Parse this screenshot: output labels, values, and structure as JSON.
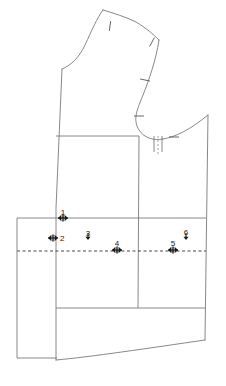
{
  "document": {
    "kind": "sewing-pattern-technical-drawing",
    "title": "Bodice Block Pattern Draft",
    "background_color": "#ffffff",
    "line_color": "#7a7a7a",
    "mark_color": "#1a1a1a",
    "width": 226,
    "height": 386
  },
  "annotations": {
    "numbered_markers": [
      {
        "id": "marker-1",
        "label": "1",
        "x": 63,
        "y": 218,
        "label_x": 63,
        "label_y": 215,
        "style": "double-arrow-horizontal",
        "arrow_width": 10
      },
      {
        "id": "marker-2",
        "label": "2",
        "x": 53,
        "y": 238,
        "label_x": 60,
        "label_y": 241,
        "style": "double-arrow-horizontal",
        "arrow_width": 10
      },
      {
        "id": "marker-3",
        "label": "3",
        "x": 88,
        "y": 240,
        "label_x": 88,
        "label_y": 236,
        "style": "down-arrow",
        "arrow_height": 7
      },
      {
        "id": "marker-4",
        "label": "4",
        "x": 117,
        "y": 250,
        "label_x": 117,
        "label_y": 246,
        "style": "double-arrow-horizontal",
        "arrow_width": 10
      },
      {
        "id": "marker-5",
        "label": "5",
        "x": 173,
        "y": 250,
        "label_x": 173,
        "label_y": 246,
        "style": "double-arrow-horizontal",
        "arrow_width": 10
      },
      {
        "id": "marker-6",
        "label": "6",
        "x": 186,
        "y": 240,
        "label_x": 186,
        "label_y": 235,
        "style": "down-arrow",
        "arrow_height": 7
      }
    ],
    "notches": [
      {
        "id": "notch-shoulder-left",
        "x": 110,
        "y": 26,
        "angle": 98
      },
      {
        "id": "notch-shoulder-right",
        "x": 152,
        "y": 42,
        "angle": 118
      },
      {
        "id": "notch-armhole-upper",
        "x": 145,
        "y": 80,
        "angle": 12
      },
      {
        "id": "notch-armhole-lower",
        "x": 139,
        "y": 116,
        "angle": 0
      },
      {
        "id": "notch-underarm",
        "x": 174,
        "y": 137,
        "angle": 0
      }
    ]
  },
  "geometry": {
    "outline_label": "bodice-outline",
    "paths": {
      "shoulder_and_neck": "M 103 10 C 113 13 126 17 136 22 C 146 28 153 34 159 40",
      "neck_curve": "M 103 10 C 97 18 92 30 85 45 C 79 58 70 66 62 69",
      "center_front": "M 62 69 L 56 208 L 56 360",
      "armhole_curve": "M 159 40 C 156 60 149 80 143 95 C 138 108 132 119 139 130 C 144 138 154 141 163 139",
      "underarm_to_side": "M 163 139 C 175 137 190 130 208 115",
      "side_seam": "M 208 115 L 205 340",
      "hem_curve": "M 56 360 C 90 357 150 348 205 340"
    },
    "inner_lines": [
      {
        "id": "chest-line",
        "type": "solid",
        "x1": 56,
        "y1": 136,
        "x2": 139,
        "y2": 136
      },
      {
        "id": "princess-seam-vertical",
        "type": "solid",
        "x1": 139,
        "y1": 136,
        "x2": 138,
        "y2": 308
      },
      {
        "id": "waist-line",
        "type": "solid",
        "x1": 17,
        "y1": 218,
        "x2": 206,
        "y2": 218
      },
      {
        "id": "hip-line",
        "type": "solid",
        "x1": 56,
        "y1": 308,
        "x2": 205,
        "y2": 308
      },
      {
        "id": "hinge-line",
        "type": "dashed",
        "x1": 17,
        "y1": 251,
        "x2": 206,
        "y2": 251
      },
      {
        "id": "extension-box-left",
        "type": "solid",
        "x1": 17,
        "y1": 218,
        "x2": 17,
        "y2": 358
      },
      {
        "id": "extension-box-bottom",
        "type": "solid",
        "x1": 17,
        "y1": 358,
        "x2": 57,
        "y2": 358
      }
    ],
    "dart_slash": {
      "id": "armhole-dart-slash",
      "dashed_x": 158,
      "dashed_y1": 136,
      "dashed_y2": 154,
      "leg_left_x": 154,
      "leg_right_x": 162,
      "leg_y1": 136,
      "leg_y2": 152
    }
  }
}
